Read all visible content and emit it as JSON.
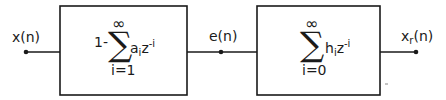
{
  "diagram": {
    "type": "block-diagram",
    "input": {
      "label": "x(n)"
    },
    "intermediate": {
      "label": "e(n)"
    },
    "output": {
      "label_base": "x",
      "label_sub": "r",
      "label_tail": "(n)"
    },
    "blocks": [
      {
        "id": "analysis-filter",
        "prefix": "1-",
        "sum_top": "∞",
        "sum_symbol": "∑",
        "sum_bottom": "i=1",
        "coef_base": "a",
        "coef_sub": "i",
        "z": "z",
        "exp": "-i"
      },
      {
        "id": "synthesis-filter",
        "prefix": "",
        "sum_top": "∞",
        "sum_symbol": "∑",
        "sum_bottom": "i=0",
        "coef_base": "h",
        "coef_sub": "i",
        "z": "z",
        "exp": "-i"
      }
    ],
    "colors": {
      "stroke": "#1a1a1a",
      "background": "#ffffff"
    }
  }
}
